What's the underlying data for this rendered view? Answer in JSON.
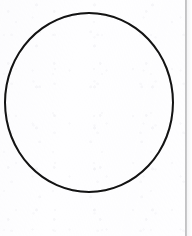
{
  "document": {
    "type": "scanned-page",
    "title": "Circle figure",
    "caption": "",
    "background_color": "#ffffff",
    "page_width": 192,
    "page_height": 236
  },
  "figure": {
    "name": "circle",
    "shape": "circle",
    "label": "",
    "stroke_color": "#141414",
    "fill_color": "transparent",
    "stroke_width_px": 2,
    "left_px": 4,
    "top_px": 12,
    "width_px": 170,
    "height_px": 181,
    "center_x_px": 89,
    "center_y_px": 102,
    "radius_x_px": 85,
    "radius_y_px": 90
  },
  "artifacts": {
    "edge_rule": {
      "name": "page-edge-rule",
      "color": "#94949 6",
      "color_hex": "#949496",
      "left_px": 185,
      "width_px": 2,
      "orientation": "vertical"
    },
    "edge_band": {
      "name": "page-edge-band",
      "color_hex": "#f3f3f5",
      "left_px": 187,
      "width_px": 5
    },
    "paper_texture": {
      "name": "paper-grain",
      "color_hex": "#e6e6ec",
      "description": ""
    }
  }
}
